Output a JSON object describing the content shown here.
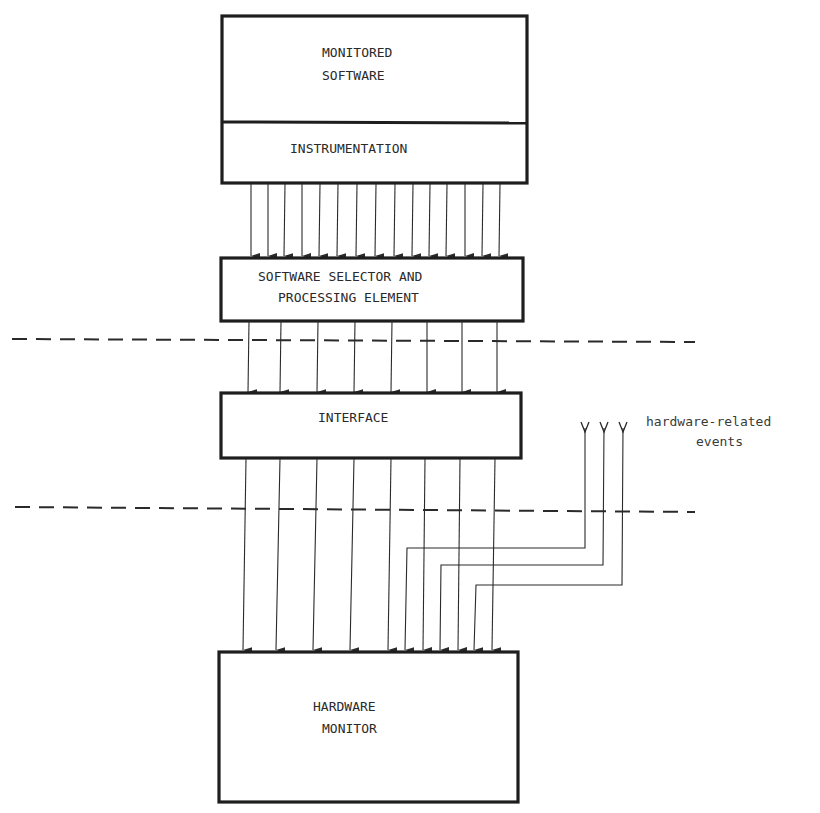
{
  "diagram": {
    "blocks": {
      "monitored_software": {
        "line1": "MONITORED",
        "line2": "SOFTWARE"
      },
      "instrumentation": {
        "label": "INSTRUMENTATION"
      },
      "selector": {
        "line1": "SOFTWARE SELECTOR AND",
        "line2": "PROCESSING ELEMENT"
      },
      "interface": {
        "label": "INTERFACE"
      },
      "hardware_monitor": {
        "line1": "HARDWARE",
        "line2": "MONITOR"
      }
    },
    "annotations": {
      "hardware_events": {
        "line1": "hardware-related",
        "line2": "events"
      }
    },
    "connections": {
      "instrumentation_to_selector": 15,
      "selector_to_interface": 8,
      "interface_to_hardware_monitor": 8,
      "hardware_events_to_hardware_monitor": 3
    },
    "boundaries": [
      {
        "name": "software/interface boundary",
        "style": "dashed"
      },
      {
        "name": "interface/hardware boundary",
        "style": "dashed"
      }
    ],
    "colors": {
      "ink": "#1e1e1e",
      "paper": "#ffffff"
    }
  }
}
